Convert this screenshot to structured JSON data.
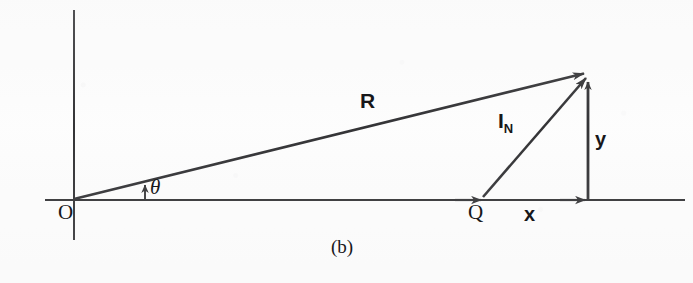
{
  "figure": {
    "caption": "(b)",
    "type": "vector-triangle-diagram",
    "background_color": "#fdfdfd",
    "ink_color": "#17171a"
  },
  "axes": {
    "origin_label": "O",
    "horizontal": {
      "x_start": 45,
      "x_end": 685,
      "y": 200
    },
    "vertical": {
      "x": 74,
      "y_start": 10,
      "y_end": 240
    }
  },
  "points": {
    "O": {
      "label": "O",
      "x": 74,
      "y": 200,
      "label_x": 60,
      "label_y": 205
    },
    "Q": {
      "label": "Q",
      "x": 481,
      "y": 200,
      "label_x": 470,
      "label_y": 205
    },
    "P": {
      "label": "",
      "x": 588,
      "y": 72
    }
  },
  "vectors": [
    {
      "name": "R",
      "label": "R",
      "from": "O",
      "to": "P",
      "x1": 74,
      "y1": 199,
      "x2": 588,
      "y2": 72,
      "label_x": 362,
      "label_y": 92,
      "arrowhead": true
    },
    {
      "name": "I_N",
      "label": "I",
      "subscript": "N",
      "from": "Q",
      "to": "P",
      "x1": 483,
      "y1": 197,
      "x2": 589,
      "y2": 74,
      "label_x": 500,
      "label_y": 113,
      "arrowhead": true
    },
    {
      "name": "x",
      "label": "x",
      "from": "Q",
      "to": "foot",
      "x1": 481,
      "y1": 200,
      "x2": 586,
      "y2": 200,
      "label_x": 525,
      "label_y": 205,
      "arrowhead": true
    },
    {
      "name": "y",
      "label": "y",
      "from": "foot",
      "to": "P",
      "x1": 588,
      "y1": 200,
      "x2": 588,
      "y2": 74,
      "label_x": 596,
      "label_y": 131,
      "arrowhead": true
    }
  ],
  "angle": {
    "label": "θ",
    "label_x": 150,
    "label_y": 178,
    "marker_x": 145,
    "marker_y_base": 199,
    "marker_y_tip": 183
  },
  "axis_arrow_at_Q": {
    "name": "axis-arrowhead-at-Q",
    "x": 481,
    "y": 200
  }
}
